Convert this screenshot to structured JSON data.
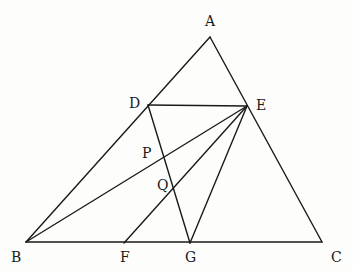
{
  "diagram": {
    "type": "geometry-figure",
    "stroke_color": "#1a1a1a",
    "background": "#fdfdfc",
    "points": {
      "A": {
        "label": "A",
        "x": 210,
        "y": 37,
        "lx": 205,
        "ly": 26
      },
      "B": {
        "label": "B",
        "x": 26,
        "y": 242,
        "lx": 11,
        "ly": 262
      },
      "C": {
        "label": "C",
        "x": 322,
        "y": 242,
        "lx": 331,
        "ly": 262
      },
      "D": {
        "label": "D",
        "x": 148,
        "y": 105,
        "lx": 129,
        "ly": 108
      },
      "E": {
        "label": "E",
        "x": 247,
        "y": 106,
        "lx": 256,
        "ly": 110
      },
      "F": {
        "label": "F",
        "x": 124,
        "y": 243,
        "lx": 120,
        "ly": 262
      },
      "G": {
        "label": "G",
        "x": 190,
        "y": 243,
        "lx": 185,
        "ly": 262
      },
      "P": {
        "label": "P",
        "x": 163,
        "y": 157,
        "lx": 142,
        "ly": 158
      },
      "Q": {
        "label": "Q",
        "x": 173,
        "y": 188,
        "lx": 157,
        "ly": 190
      }
    },
    "segments": [
      [
        "A",
        "B"
      ],
      [
        "A",
        "C"
      ],
      [
        "B",
        "C"
      ],
      [
        "D",
        "E"
      ],
      [
        "D",
        "G"
      ],
      [
        "B",
        "E"
      ],
      [
        "F",
        "E"
      ],
      [
        "G",
        "E"
      ]
    ]
  }
}
